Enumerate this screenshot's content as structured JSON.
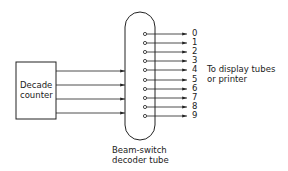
{
  "diagram": {
    "counter": {
      "label_line1": "Decade",
      "label_line2": "counter"
    },
    "tube": {
      "label_line1": "Beam-switch",
      "label_line2": "decoder tube"
    },
    "inputs": {
      "count": 4
    },
    "outputs": [
      "0",
      "1",
      "2",
      "3",
      "4",
      "5",
      "6",
      "7",
      "8",
      "9"
    ],
    "destination": {
      "line1": "To display tubes",
      "line2": "or printer"
    },
    "colors": {
      "line": "#222222",
      "background": "#ffffff"
    }
  }
}
